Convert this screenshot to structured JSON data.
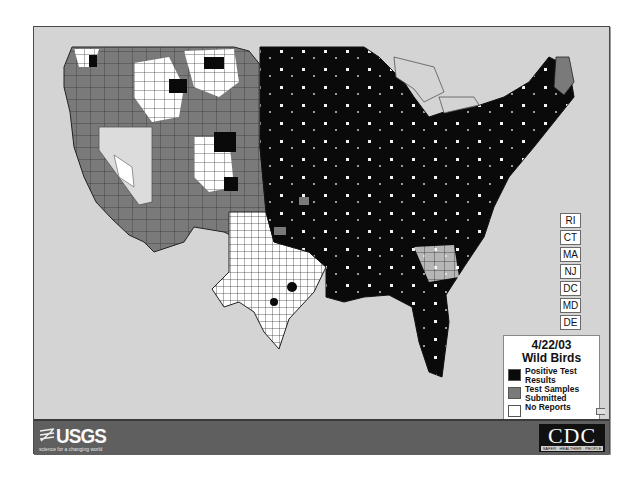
{
  "map": {
    "title_date": "4/22/03",
    "title_subject": "Wild Birds",
    "region": "Contiguous United States (county level)",
    "colors": {
      "background_ocean": "#d4d4d4",
      "positive": "#0a0a0a",
      "submitted": "#7a7a7a",
      "no_reports": "#ffffff",
      "banner": "#5f5f5f"
    }
  },
  "legend": {
    "date": "4/22/03",
    "title": "Wild Birds",
    "items": [
      {
        "label": "Positive Test Results",
        "color": "#0a0a0a"
      },
      {
        "label": "Test Samples Submitted",
        "color": "#7a7a7a"
      },
      {
        "label": "No Reports",
        "color": "#ffffff"
      }
    ]
  },
  "state_labels": [
    "RI",
    "CT",
    "MA",
    "NJ",
    "DC",
    "MD",
    "DE"
  ],
  "banner": {
    "left_logo": "USGS",
    "left_tagline": "science for a changing world",
    "right_logo": "CDC",
    "right_tagline": "SAFER · HEALTHIER · PEOPLE"
  }
}
